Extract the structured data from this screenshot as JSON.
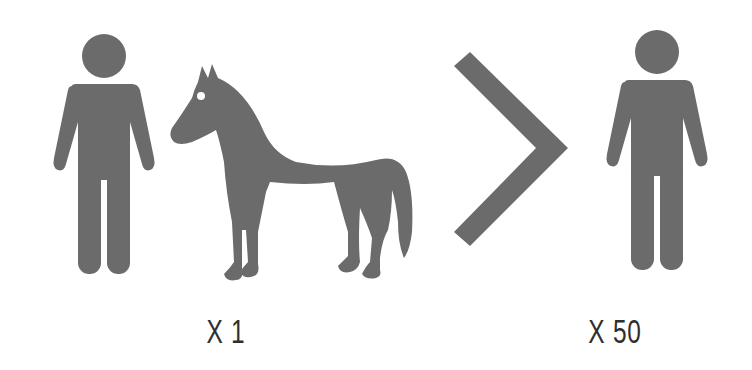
{
  "colors": {
    "icon_fill": "#6b6b6b",
    "label_text": "#2f2f2f",
    "background": "#ffffff",
    "horse_eye": "#ffffff"
  },
  "figure": {
    "left_group": {
      "icons": [
        "person-icon",
        "horse-icon"
      ],
      "multiplier_label": "X 1"
    },
    "comparison": {
      "icon": "chevron-right-icon",
      "meaning": "greater-than"
    },
    "right_group": {
      "icons": [
        "person-icon"
      ],
      "multiplier_label": "X 50"
    }
  }
}
